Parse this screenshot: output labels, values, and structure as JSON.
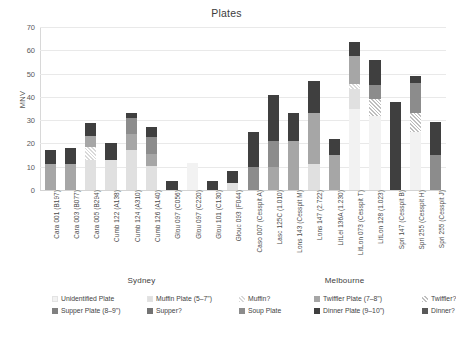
{
  "chart_data": {
    "type": "bar",
    "subtype": "stacked-bar",
    "title": "Plates",
    "xlabel": "",
    "ylabel": "MNV",
    "ylim": [
      0,
      70
    ],
    "yticks": [
      0,
      10,
      20,
      30,
      40,
      50,
      60,
      70
    ],
    "grid": true,
    "legend_position": "bottom",
    "group_labels": [
      "Sydney",
      "Melbourne"
    ],
    "groups": [
      {
        "name": "Sydney",
        "start_index": 0,
        "end_index": 9
      },
      {
        "name": "Melbourne",
        "start_index": 10,
        "end_index": 19
      }
    ],
    "categories": [
      "Cara 001 (B197)",
      "Cara 003 (B077)",
      "Cara 005 (B294)",
      "Cumb 122 (A138)",
      "Cumb 124 (A310)",
      "Cumb 126 (A140)",
      "Glou 097 (C056)",
      "Glou 097 (C220)",
      "Glou 101 (C130)",
      "Glouc 093 (F044)",
      "Caso 007 (Cesspit A)",
      "Lasc 125C (1.010)",
      "Lons 143 (Cesspit M)",
      "Lons 147 (2.722)",
      "LitLei 136A (1.230)",
      "LitLon 073 (Cesspit T)",
      "LitLon 128 (1.023)",
      "Spri 147 (Cesspit B)",
      "Spri 255 (Cesspit H)",
      "Spri 255 (Cesspit J)"
    ],
    "series": [
      {
        "name": "Unidentified Plate",
        "key": "unidentified_plate",
        "color": "#f2f2f2",
        "pattern": "solid",
        "values": [
          0,
          0,
          0,
          0,
          0,
          0,
          0,
          11.5,
          0,
          0,
          0,
          0,
          0,
          0,
          0,
          35,
          32,
          0,
          25,
          0
        ]
      },
      {
        "name": "Muffin Plate (5–7\")",
        "key": "muffin_plate",
        "color": "#e0e0e0",
        "pattern": "solid",
        "values": [
          0,
          0,
          13,
          13,
          17,
          12,
          0,
          0,
          0,
          3,
          0,
          0,
          0,
          11,
          0,
          8.5,
          0,
          0,
          0,
          0
        ]
      },
      {
        "name": "Muffin?",
        "key": "muffin",
        "color": "#d9d9d9",
        "pattern": "hatch",
        "values": [
          0,
          0,
          5.5,
          0,
          0,
          0,
          0,
          0,
          0,
          0,
          0,
          0,
          0,
          0,
          0,
          2,
          0,
          0,
          0,
          0
        ]
      },
      {
        "name": "Twiffler Plate (7–8\")",
        "key": "twiffler_plate",
        "color": "#a6a6a6",
        "pattern": "solid",
        "values": [
          11,
          11,
          4.5,
          0,
          7,
          6,
          0,
          0,
          0,
          0,
          0,
          10,
          21,
          22,
          15,
          12,
          0,
          0,
          0,
          0
        ]
      },
      {
        "name": "Twiffler?",
        "key": "twiffler",
        "color": "#bfbfbf",
        "pattern": "hatch",
        "values": [
          0,
          0,
          0,
          0,
          0,
          0,
          0,
          0,
          0,
          0,
          0,
          0,
          0,
          0,
          0,
          0,
          7,
          0,
          8,
          0
        ]
      },
      {
        "name": "Supper Plate (8–9\")",
        "key": "supper_plate",
        "color": "#808080",
        "pattern": "solid",
        "values": [
          0,
          0,
          0,
          0,
          0,
          0,
          0,
          0,
          0,
          0,
          0,
          0,
          0,
          0,
          0,
          0,
          0,
          0,
          0,
          0
        ]
      },
      {
        "name": "Supper?",
        "key": "supper",
        "color": "#737373",
        "pattern": "solid",
        "values": [
          0,
          0,
          0,
          0,
          0,
          0,
          0,
          0,
          0,
          0,
          0,
          0,
          0,
          0,
          0,
          0,
          0,
          0,
          0,
          0
        ]
      },
      {
        "name": "Soup Plate",
        "key": "soup_plate",
        "color": "#8c8c8c",
        "pattern": "solid",
        "values": [
          0,
          0,
          0,
          0,
          7,
          8,
          0,
          0,
          0,
          0,
          10,
          11,
          0,
          0,
          0,
          0,
          6,
          0,
          13,
          15
        ]
      },
      {
        "name": "Dinner Plate (9–10\")",
        "key": "dinner_plate",
        "color": "#3f3f3f",
        "pattern": "solid",
        "values": [
          6,
          7,
          6,
          7,
          2,
          5,
          4,
          0,
          4,
          5,
          15,
          20,
          12,
          14,
          7,
          6,
          11,
          38,
          3,
          14
        ]
      },
      {
        "name": "Dinner?",
        "key": "dinner",
        "color": "#595959",
        "pattern": "solid",
        "values": [
          0,
          0,
          0,
          0,
          0,
          0,
          0,
          0,
          0,
          0,
          0,
          0,
          0,
          0,
          0,
          0,
          0,
          0,
          0,
          0
        ]
      }
    ],
    "bar_totals": [
      17,
      18,
      29,
      20,
      33,
      27,
      4,
      11.5,
      4,
      8,
      25,
      41,
      33,
      47,
      22,
      63.5,
      56,
      38,
      49,
      29
    ]
  },
  "legend": {
    "items": [
      {
        "label": "Unidentified Plate",
        "key": "unidentified_plate"
      },
      {
        "label": "Muffin Plate (5–7\")",
        "key": "muffin_plate"
      },
      {
        "label": "Muffin?",
        "key": "muffin"
      },
      {
        "label": "Twiffler Plate (7–8\")",
        "key": "twiffler_plate"
      },
      {
        "label": "Twiffler?",
        "key": "twiffler"
      },
      {
        "label": "Supper Plate (8–9\")",
        "key": "supper_plate"
      },
      {
        "label": "Supper?",
        "key": "supper"
      },
      {
        "label": "Soup Plate",
        "key": "soup_plate"
      },
      {
        "label": "Dinner Plate (9–10\")",
        "key": "dinner_plate"
      },
      {
        "label": "Dinner?",
        "key": "dinner"
      }
    ]
  }
}
